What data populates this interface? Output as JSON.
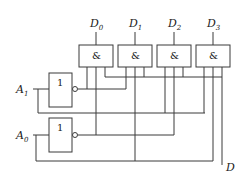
{
  "diagram": {
    "type": "logic-circuit",
    "title": "",
    "colors": {
      "line": "#3a3a3a",
      "background": "#ffffff",
      "text": "#222222"
    },
    "inputs": [
      {
        "id": "A1",
        "label": "A",
        "subscript": "1"
      },
      {
        "id": "A0",
        "label": "A",
        "subscript": "0"
      }
    ],
    "not_gates": [
      {
        "id": "not_a1",
        "symbol": "1",
        "input": "A1"
      },
      {
        "id": "not_a0",
        "symbol": "1",
        "input": "A0"
      }
    ],
    "and_gates": [
      {
        "id": "g0",
        "symbol": "&",
        "output": {
          "label": "D",
          "subscript": "0"
        },
        "inputs": [
          "A1'",
          "A0'",
          "D"
        ]
      },
      {
        "id": "g1",
        "symbol": "&",
        "output": {
          "label": "D",
          "subscript": "1"
        },
        "inputs": [
          "A1'",
          "A0",
          "D"
        ]
      },
      {
        "id": "g2",
        "symbol": "&",
        "output": {
          "label": "D",
          "subscript": "2"
        },
        "inputs": [
          "A1",
          "A0'",
          "D"
        ]
      },
      {
        "id": "g3",
        "symbol": "&",
        "output": {
          "label": "D",
          "subscript": "3"
        },
        "inputs": [
          "A1",
          "A0",
          "D"
        ]
      }
    ],
    "data_input": {
      "label": "D"
    }
  }
}
